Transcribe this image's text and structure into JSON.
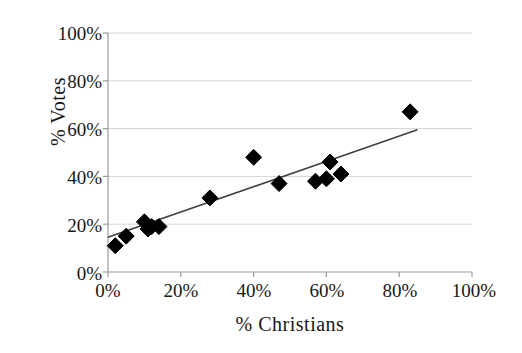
{
  "chart_data": {
    "type": "scatter",
    "title": "",
    "xlabel": "% Christians",
    "ylabel": "% Votes",
    "xlim": [
      0,
      100
    ],
    "ylim": [
      0,
      100
    ],
    "xticks": [
      "0%",
      "20%",
      "40%",
      "60%",
      "80%",
      "100%"
    ],
    "xtick_values": [
      0,
      20,
      40,
      60,
      80,
      100
    ],
    "yticks": [
      "0%",
      "20%",
      "40%",
      "60%",
      "80%",
      "100%"
    ],
    "ytick_values": [
      0,
      20,
      40,
      60,
      80,
      100
    ],
    "grid": "horizontal",
    "legend": "none",
    "marker": "diamond",
    "marker_color": "#000000",
    "marker_size": 13,
    "points": [
      {
        "x": 2,
        "y": 11
      },
      {
        "x": 5,
        "y": 15
      },
      {
        "x": 10,
        "y": 21
      },
      {
        "x": 11,
        "y": 18
      },
      {
        "x": 12,
        "y": 19
      },
      {
        "x": 14,
        "y": 19
      },
      {
        "x": 28,
        "y": 31
      },
      {
        "x": 40,
        "y": 48
      },
      {
        "x": 47,
        "y": 37
      },
      {
        "x": 57,
        "y": 38
      },
      {
        "x": 60,
        "y": 39
      },
      {
        "x": 61,
        "y": 46
      },
      {
        "x": 64,
        "y": 41
      },
      {
        "x": 83,
        "y": 67
      }
    ],
    "series": [
      {
        "name": "Observations",
        "x": [
          2,
          5,
          10,
          11,
          12,
          14,
          28,
          40,
          47,
          57,
          60,
          61,
          64,
          83
        ],
        "values": [
          11,
          15,
          21,
          18,
          19,
          19,
          31,
          48,
          37,
          38,
          39,
          46,
          41,
          67
        ]
      }
    ],
    "trendline": {
      "type": "linear",
      "color": "#404040",
      "x_start": 0,
      "y_start": 14.5,
      "x_end": 85,
      "y_end": 59.5
    },
    "colors": {
      "marker": "#000000",
      "trendline": "#404040",
      "grid": "#d4d4d4",
      "axis": "#9a9a9a",
      "text": "#181818",
      "background": "#ffffff"
    }
  },
  "axes": {
    "y_title": "% Votes",
    "x_title": "% Christians",
    "y_tick_labels": [
      "100%",
      "80%",
      "60%",
      "40%",
      "20%",
      "0%"
    ],
    "x_tick_labels": [
      "0%",
      "20%",
      "40%",
      "60%",
      "80%",
      "100%"
    ]
  }
}
